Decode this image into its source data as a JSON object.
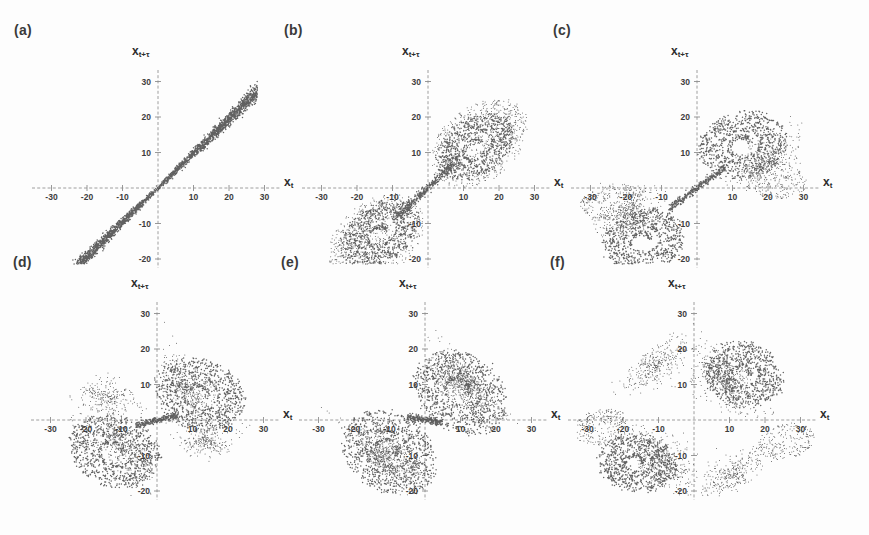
{
  "figure": {
    "background_color": "#fdfdfd",
    "point_color": "#3a3a3a",
    "axis_color": "#8d8d8d",
    "label_color": "#3a3a3a",
    "axis_labels": {
      "x": "x",
      "x_sub": "t",
      "y": "x",
      "y_sub": "t+τ"
    },
    "tick_values": [
      -30,
      -20,
      -10,
      10,
      20,
      30
    ],
    "tick_labels_x": [
      "-30",
      "-20",
      "-10",
      "10",
      "20",
      "30"
    ],
    "tick_labels_y": [
      "30",
      "20",
      "10",
      "-10",
      "-20",
      "-30"
    ],
    "axis_range": [
      -35,
      35
    ],
    "panels": [
      {
        "label": "(a)",
        "name": "panel-a",
        "description": "narrow diagonal band, near-linear correlation, very small delay"
      },
      {
        "label": "(b)",
        "name": "panel-b",
        "description": "two spiral lobes along the diagonal in quadrants I and III"
      },
      {
        "label": "(c)",
        "name": "panel-c",
        "description": "lobes rotated and unfolded, triangular envelope"
      },
      {
        "label": "(d)",
        "name": "panel-d",
        "description": "bowtie/butterfly with sharp cusp at the origin"
      },
      {
        "label": "(e)",
        "name": "panel-e",
        "description": "further stretched and folded butterfly, vertical cusp"
      },
      {
        "label": "(f)",
        "name": "panel-f",
        "description": "broad diagonal sheet with spirals in quadrants I and III"
      }
    ]
  },
  "chart_data": {
    "type": "scatter",
    "title": "",
    "xlabel": "x_t",
    "ylabel": "x_{t+tau}",
    "xlim": [
      -35,
      35
    ],
    "ylim": [
      -35,
      35
    ],
    "xticks": [
      -30,
      -20,
      -10,
      10,
      20,
      30
    ],
    "yticks": [
      -30,
      -20,
      -10,
      10,
      20,
      30
    ],
    "grid": false,
    "legend": null,
    "panel_count": 6,
    "panels": [
      {
        "panel": "(a)",
        "tau_relative": 1,
        "n_points": 2600,
        "structure": "thin diagonal band",
        "band_slope": 0.97,
        "band_halfwidth": 1.6,
        "extent": [
          -28,
          28
        ],
        "lobe_centers": [],
        "envelope": "line"
      },
      {
        "panel": "(b)",
        "tau_relative": 2,
        "n_points": 3200,
        "structure": "two spiral lobes plus diagonal bridge",
        "band_slope": 0.9,
        "band_halfwidth": 3.0,
        "extent": [
          -30,
          30
        ],
        "lobe_centers": [
          [
            13.5,
            11.5
          ],
          [
            -13.5,
            -13.0
          ]
        ],
        "lobe_radii": [
          [
            12.0,
            8.0
          ],
          [
            12.0,
            8.0
          ]
        ],
        "lobe_rotation_deg": [
          38,
          38
        ],
        "envelope": "elongated-s"
      },
      {
        "panel": "(c)",
        "tau_relative": 3,
        "n_points": 3400,
        "structure": "rotated lobes, triangular wings",
        "band_slope": 0.62,
        "band_halfwidth": 2.4,
        "extent": [
          -32,
          32
        ],
        "lobe_centers": [
          [
            13.0,
            12.0
          ],
          [
            -15.0,
            -15.0
          ]
        ],
        "lobe_radii": [
          [
            12.5,
            9.5
          ],
          [
            11.5,
            9.0
          ]
        ],
        "lobe_rotation_deg": [
          14,
          14
        ],
        "envelope": "triangular"
      },
      {
        "panel": "(d)",
        "tau_relative": 4,
        "n_points": 3600,
        "structure": "bowtie with cusp at origin",
        "band_slope": 0.15,
        "band_halfwidth": 2.0,
        "extent": [
          -32,
          32
        ],
        "lobe_centers": [
          [
            12.0,
            7.0
          ],
          [
            -12.0,
            -9.0
          ]
        ],
        "lobe_radii": [
          [
            13.0,
            10.0
          ],
          [
            13.0,
            10.0
          ]
        ],
        "lobe_rotation_deg": [
          -18,
          -18
        ],
        "envelope": "bowtie"
      },
      {
        "panel": "(e)",
        "tau_relative": 5,
        "n_points": 3800,
        "structure": "stretched folded butterfly, vertical cusp",
        "band_slope": -0.1,
        "band_halfwidth": 2.2,
        "extent": [
          -33,
          33
        ],
        "lobe_centers": [
          [
            10.0,
            8.0
          ],
          [
            -10.0,
            -9.0
          ]
        ],
        "lobe_radii": [
          [
            14.0,
            11.0
          ],
          [
            14.0,
            11.0
          ]
        ],
        "lobe_rotation_deg": [
          -32,
          -32
        ],
        "envelope": "folded"
      },
      {
        "panel": "(f)",
        "tau_relative": 6,
        "n_points": 4000,
        "structure": "broad sheet with two spirals, tall cusps",
        "band_slope": -0.35,
        "band_halfwidth": 3.0,
        "extent": [
          -33,
          33
        ],
        "lobe_centers": [
          [
            14.0,
            13.0
          ],
          [
            -16.0,
            -12.0
          ]
        ],
        "lobe_radii": [
          [
            11.0,
            9.0
          ],
          [
            11.0,
            8.0
          ]
        ],
        "lobe_rotation_deg": [
          -8,
          -8
        ],
        "envelope": "sheet"
      }
    ]
  }
}
